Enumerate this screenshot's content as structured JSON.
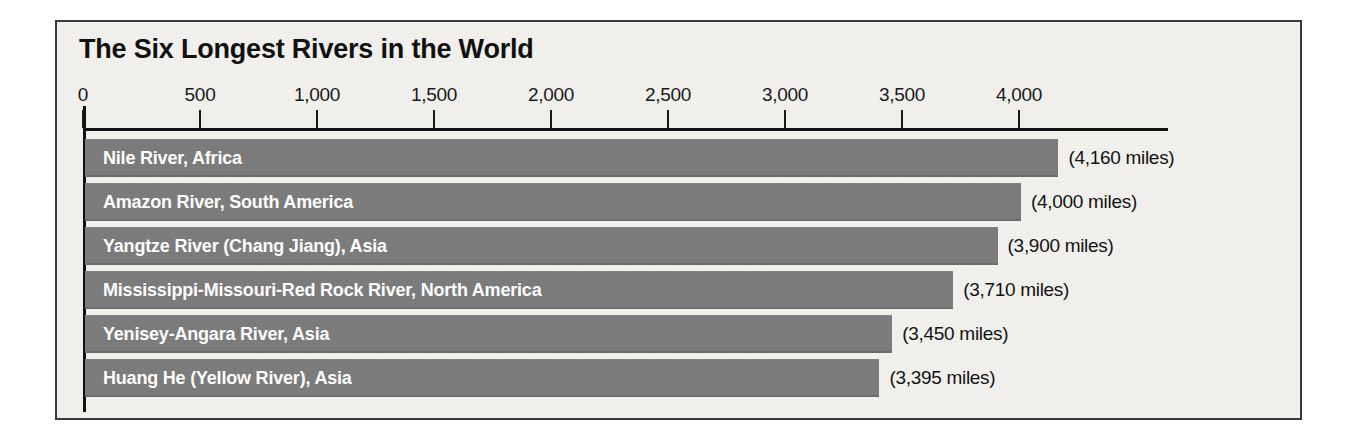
{
  "chart_data": {
    "type": "bar",
    "orientation": "horizontal",
    "title": "The Six Longest Rivers in the World",
    "xlabel": "",
    "ylabel": "",
    "xlim": [
      0,
      4400
    ],
    "grid": false,
    "legend": "none",
    "unit": "miles",
    "tick_labels": [
      "0",
      "500",
      "1,000",
      "1,500",
      "2,000",
      "2,500",
      "3,000",
      "3,500",
      "4,000"
    ],
    "tick_values": [
      0,
      500,
      1000,
      1500,
      2000,
      2500,
      3000,
      3500,
      4000
    ],
    "categories": [
      "Nile River, Africa",
      "Amazon River, South America",
      "Yangtze River (Chang Jiang), Asia",
      "Mississippi-Missouri-Red Rock River, North America",
      "Yenisey-Angara River, Asia",
      "Huang He (Yellow River), Asia"
    ],
    "values": [
      4160,
      4000,
      3900,
      3710,
      3450,
      3395
    ],
    "value_labels": [
      "(4,160 miles)",
      "(4,000 miles)",
      "(3,900 miles)",
      "(3,710 miles)",
      "(3,450 miles)",
      "(3,395 miles)"
    ],
    "colors": {
      "bar": "#7c7c7c",
      "panel_background": "#f2f1ee",
      "frame": "#3b3b3b",
      "axis": "#111111",
      "title_text": "#111111",
      "bar_label_text": "#ffffff",
      "value_label_text": "#131313"
    }
  }
}
